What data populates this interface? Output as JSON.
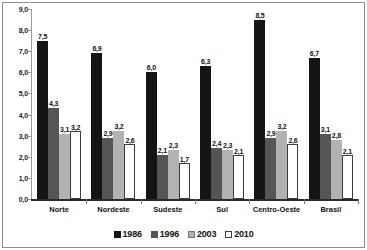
{
  "chart_data": {
    "type": "bar",
    "title": "",
    "xlabel": "",
    "ylabel": "",
    "ylim": [
      0,
      9
    ],
    "ytick_labels": [
      "9,0",
      "8,0",
      "7,0",
      "6,0",
      "5,0",
      "4,0",
      "3,0",
      "2,0",
      "1,0",
      "0,0"
    ],
    "ytick_values": [
      9,
      8,
      7,
      6,
      5,
      4,
      3,
      2,
      1,
      0
    ],
    "grid": false,
    "legend_position": "bottom",
    "decimal_separator": ",",
    "categories": [
      "Norte",
      "Nordeste",
      "Sudeste",
      "Sul",
      "Centro-Oeste",
      "Brasil"
    ],
    "series": [
      {
        "name": "1986",
        "color": "#141414",
        "values": [
          7.5,
          6.9,
          6.0,
          6.3,
          8.5,
          6.7
        ],
        "labels": [
          "7,5",
          "6,9",
          "6,0",
          "6,3",
          "8,5",
          "6,7"
        ]
      },
      {
        "name": "1996",
        "color": "#555555",
        "values": [
          4.3,
          2.9,
          2.1,
          2.4,
          2.9,
          3.1
        ],
        "labels": [
          "4,3",
          "2,9",
          "2,1",
          "2,4",
          "2,9",
          "3,1"
        ]
      },
      {
        "name": "2003",
        "color": "#b2b2b2",
        "values": [
          3.1,
          3.2,
          2.3,
          2.3,
          3.2,
          2.8
        ],
        "labels": [
          "3,1",
          "3,2",
          "2,3",
          "2,3",
          "3,2",
          "2,8"
        ]
      },
      {
        "name": "2010",
        "color": "#ffffff",
        "values": [
          3.2,
          2.6,
          1.7,
          2.1,
          2.6,
          2.1
        ],
        "labels": [
          "3,2",
          "2,6",
          "1,7",
          "2,1",
          "2,6",
          "2,1"
        ]
      }
    ]
  },
  "legend": {
    "items": [
      {
        "label": "1986"
      },
      {
        "label": "1996"
      },
      {
        "label": "2003"
      },
      {
        "label": "2010"
      }
    ]
  }
}
